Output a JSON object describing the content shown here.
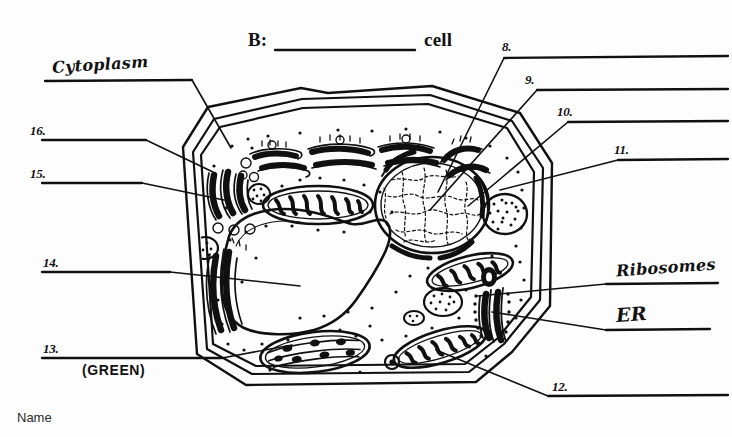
{
  "worksheet": {
    "section_prefix": "B:",
    "section_suffix": "cell",
    "blank_answer": "",
    "name_label": "Name"
  },
  "named_labels": [
    {
      "id": "cytoplasm",
      "text": "Cytoplasm",
      "style": "cursive",
      "side": "left"
    },
    {
      "id": "ribosomes",
      "text": "Ribosomes",
      "style": "cursive",
      "side": "right"
    },
    {
      "id": "er",
      "text": "ER",
      "style": "cursive",
      "side": "right"
    },
    {
      "id": "green",
      "text": "(GREEN)",
      "style": "print",
      "side": "left"
    }
  ],
  "numbered_blanks": [
    {
      "number": "8.",
      "side": "right",
      "answer": ""
    },
    {
      "number": "9.",
      "side": "right",
      "answer": ""
    },
    {
      "number": "10.",
      "side": "right",
      "answer": ""
    },
    {
      "number": "11.",
      "side": "right",
      "answer": ""
    },
    {
      "number": "12.",
      "side": "right",
      "answer": ""
    },
    {
      "number": "13.",
      "side": "left",
      "answer": ""
    },
    {
      "number": "14.",
      "side": "left",
      "answer": ""
    },
    {
      "number": "15.",
      "side": "left",
      "answer": ""
    },
    {
      "number": "16.",
      "side": "left",
      "answer": ""
    }
  ],
  "diagram": {
    "ink_color": "#101010",
    "paper_color": "#fdfdfd"
  }
}
